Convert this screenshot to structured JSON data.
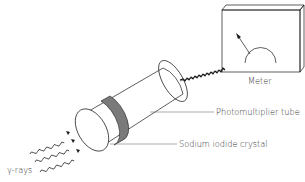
{
  "figure": {
    "labels": {
      "meter": "Meter",
      "photomultiplier": "Photomultiplier tube",
      "crystal": "Sodium iodide crystal",
      "gamma": "γ-rays"
    },
    "components": [
      {
        "name": "meter",
        "type": "box-with-dial-gauge"
      },
      {
        "name": "photomultiplier-tube",
        "type": "cylinder"
      },
      {
        "name": "sodium-iodide-crystal",
        "type": "band-on-cylinder",
        "color": "#7a7a7a"
      },
      {
        "name": "cable",
        "type": "coiled-wire"
      },
      {
        "name": "gamma-rays",
        "type": "wavy-arrows",
        "count": 3
      }
    ],
    "colors": {
      "line": "#1a1a1a",
      "crystal_band": "#7a7a7a",
      "text": "#333333",
      "background": "#ffffff"
    }
  }
}
